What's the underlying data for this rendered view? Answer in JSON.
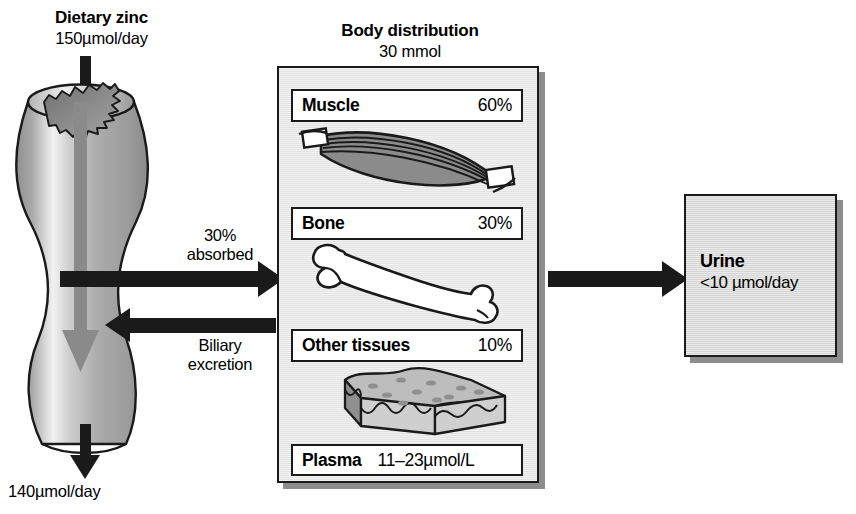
{
  "diagram": {
    "intake": {
      "title": "Dietary zinc",
      "amount": "150µmol/day"
    },
    "fecal_output": "140µmol/day",
    "flows": [
      {
        "id": "absorbed",
        "line1": "30%",
        "line2": "absorbed",
        "direction": "gut-to-body"
      },
      {
        "id": "biliary",
        "line1": "Biliary",
        "line2": "excretion",
        "direction": "body-to-gut"
      }
    ],
    "body": {
      "title": "Body distribution",
      "amount": "30 mmol",
      "compartments": [
        {
          "name": "Muscle",
          "value": "60%",
          "icon": "muscle-icon"
        },
        {
          "name": "Bone",
          "value": "30%",
          "icon": "bone-icon"
        },
        {
          "name": "Other tissues",
          "value": "10%",
          "icon": "tissue-slab-icon"
        },
        {
          "name": "Plasma",
          "value": "11–23µmol/L",
          "icon": "none"
        }
      ]
    },
    "urine": {
      "name": "Urine",
      "value": "<10 µmol/day"
    },
    "colors": {
      "ink": "#1a1a1a",
      "panel_fill": "#e3e3e3",
      "urine_fill": "#d5d5d5",
      "shadow": "#8d8d8d",
      "label_fill": "#ffffff"
    }
  }
}
